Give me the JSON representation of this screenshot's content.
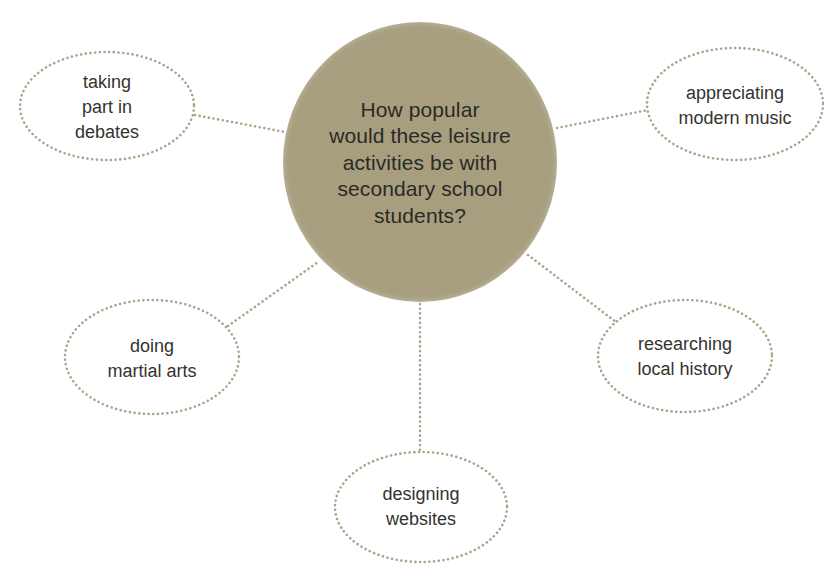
{
  "diagram": {
    "type": "mind-map",
    "colors": {
      "hub_fill": "#a89f80",
      "hub_rim": "#c6bfa6",
      "dots": "#a9a58b",
      "text": "#333330"
    },
    "center": {
      "lines": [
        "How popular",
        "would these leisure",
        "activities be with",
        "secondary school",
        "students?"
      ]
    },
    "nodes": [
      {
        "id": "debates",
        "lines": [
          "taking",
          "part in",
          "debates"
        ]
      },
      {
        "id": "music",
        "lines": [
          "appreciating",
          "modern music"
        ]
      },
      {
        "id": "martial-arts",
        "lines": [
          "doing",
          "martial arts"
        ]
      },
      {
        "id": "history",
        "lines": [
          "researching",
          "local history"
        ]
      },
      {
        "id": "websites",
        "lines": [
          "designing",
          "websites"
        ]
      }
    ]
  }
}
